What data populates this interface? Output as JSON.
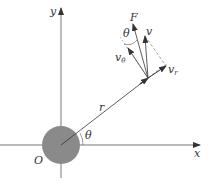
{
  "diagram": {
    "type": "polar-coordinate-velocity-decomposition",
    "colors": {
      "axis": "#555555",
      "body_fill": "#8a8a8a",
      "vector": "#333333",
      "dashed": "#666666",
      "background": "#ffffff"
    },
    "labels": {
      "y_axis": "y",
      "x_axis": "x",
      "origin": "O",
      "radius": "r",
      "angle_at_origin": "θ",
      "angle_at_tip": "θ",
      "force": "F",
      "velocity": "v",
      "velocity_theta_main": "v",
      "velocity_theta_sub": "θ",
      "velocity_r_main": "v",
      "velocity_r_sub": "r"
    }
  }
}
